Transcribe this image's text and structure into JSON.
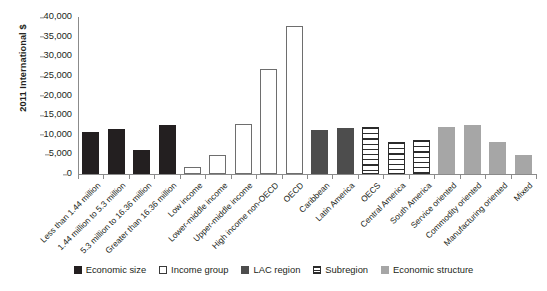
{
  "chart_data": {
    "type": "bar",
    "title": "",
    "xlabel": "",
    "ylabel": "2011 International $",
    "ylim": [
      0,
      40000
    ],
    "ytick_labels": [
      "40,000",
      "35,000",
      "30,000",
      "25,000",
      "20,000",
      "15,000",
      "10,000",
      "5,000",
      "0"
    ],
    "ytick_values": [
      40000,
      35000,
      30000,
      25000,
      20000,
      15000,
      10000,
      5000,
      0
    ],
    "grid": false,
    "legend_position": "bottom",
    "categories": [
      "Less than 1.44 million",
      "1.44 million to 5.3 million",
      "5.3 million to 16.36 million",
      "Greater than 16.36 million",
      "Low income",
      "Lower-middle income",
      "Upper-middle income",
      "High income non-OECD",
      "OECD",
      "Caribbean",
      "Latin America",
      "OECS",
      "Central America",
      "South America",
      "Service oriented",
      "Commodity oriented",
      "Manufacturing oriented",
      "Mixed"
    ],
    "values": [
      10600,
      11500,
      6200,
      12400,
      1700,
      4800,
      12700,
      26800,
      37600,
      11300,
      11700,
      11900,
      8200,
      8700,
      12000,
      12400,
      8100,
      4900
    ],
    "groups": [
      "Economic size",
      "Economic size",
      "Economic size",
      "Economic size",
      "Income group",
      "Income group",
      "Income group",
      "Income group",
      "Income group",
      "LAC region",
      "LAC region",
      "Subregion",
      "Subregion",
      "Subregion",
      "Economic structure",
      "Economic structure",
      "Economic structure",
      "Economic structure"
    ],
    "legend": [
      {
        "label": "Economic size",
        "key": "cat-size",
        "color": "#231f20",
        "pattern": "solid"
      },
      {
        "label": "Income group",
        "key": "cat-income",
        "color": "#ffffff",
        "pattern": "outline"
      },
      {
        "label": "LAC region",
        "key": "cat-lac",
        "color": "#4d4d4d",
        "pattern": "solid"
      },
      {
        "label": "Subregion",
        "key": "cat-subregion",
        "color": "#ffffff",
        "pattern": "horizontal-hatch"
      },
      {
        "label": "Economic structure",
        "key": "cat-structure",
        "color": "#a6a6a6",
        "pattern": "solid"
      }
    ]
  }
}
